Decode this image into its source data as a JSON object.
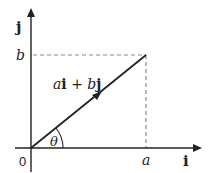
{
  "diagram": {
    "axes": {
      "x_label": "i",
      "y_label": "j",
      "origin_label": "0"
    },
    "ticks": {
      "x_tick": "a",
      "y_tick": "b"
    },
    "vector": {
      "label_a": "a",
      "label_i": "i",
      "label_plus": "+",
      "label_b": "b",
      "label_j": "j",
      "full_label": "ai + bj"
    },
    "angle": {
      "label": "θ"
    },
    "colors": {
      "line": "#222222",
      "dashed": "#8a8a8a",
      "background": "#ffffff"
    }
  }
}
